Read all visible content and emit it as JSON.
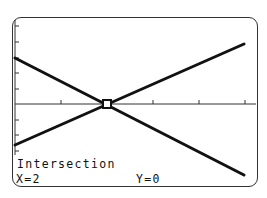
{
  "screen": {
    "mode": "Intersection",
    "x_readout": "X=2",
    "y_readout": "Y=0"
  },
  "graph": {
    "x_axis_ticks_px": [
      61,
      107,
      153,
      199,
      245
    ],
    "y_axis_ticks_px": [
      26,
      42,
      58,
      73,
      89,
      120,
      135,
      151
    ],
    "lines": [
      {
        "name": "increasing-line",
        "from": [
          15,
          145
        ],
        "to": [
          244,
          44
        ]
      },
      {
        "name": "decreasing-line",
        "from": [
          15,
          58
        ],
        "to": [
          244,
          175
        ]
      }
    ],
    "cursor_px": [
      107,
      104
    ],
    "line_color": "#111111",
    "axis_color": "#333333"
  }
}
